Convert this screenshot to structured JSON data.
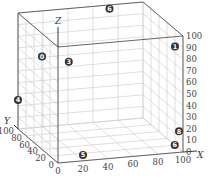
{
  "chart_data": {
    "type": "scatter",
    "subtype": "3d-scatter",
    "title": "",
    "xlabel": "X",
    "ylabel": "Y",
    "zlabel": "Z",
    "xlim": [
      0,
      100
    ],
    "ylim": [
      0,
      100
    ],
    "zlim": [
      0,
      100
    ],
    "x_ticks": [
      "0",
      "20",
      "40",
      "60",
      "80",
      "100"
    ],
    "y_ticks": [
      "0",
      "20",
      "40",
      "60",
      "80",
      "100"
    ],
    "z_ticks": [
      "0",
      "10",
      "20",
      "30",
      "40",
      "50",
      "60",
      "70",
      "80",
      "90",
      "100"
    ],
    "grid": true,
    "points": [
      {
        "label": "0",
        "x": 0,
        "y": 40,
        "z": 80
      },
      {
        "label": "3",
        "x": 15,
        "y": 20,
        "z": 80
      },
      {
        "label": "6",
        "x": 70,
        "y": 90,
        "z": 100
      },
      {
        "label": "1",
        "x": 100,
        "y": 20,
        "z": 85
      },
      {
        "label": "4",
        "x": 0,
        "y": 100,
        "z": 25
      },
      {
        "label": "5",
        "x": 20,
        "y": 0,
        "z": 5
      },
      {
        "label": "8",
        "x": 100,
        "y": 10,
        "z": 15
      },
      {
        "label": "6",
        "x": 95,
        "y": 5,
        "z": 5
      }
    ]
  }
}
